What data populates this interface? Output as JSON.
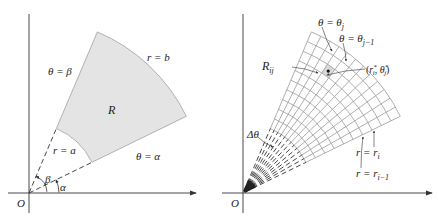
{
  "left_panel": {
    "origin_label": "O",
    "region_label": "R",
    "outer_arc_label": "r = b",
    "inner_arc_label": "r = a",
    "upper_ray_label": "θ = β",
    "lower_ray_label": "θ = α",
    "angle_beta_label": "β",
    "angle_alpha_label": "α",
    "colors": {
      "region_fill": "#e4e4e4",
      "region_stroke": "#a8a8a8",
      "axis": "#333333"
    },
    "geometry": {
      "origin": [
        29,
        193
      ],
      "alpha_deg": 26,
      "beta_deg": 67,
      "a": 70,
      "b": 175
    }
  },
  "right_panel": {
    "origin_label": "O",
    "cell_label": "R",
    "cell_label_sub": "ij",
    "sample_point_label": "(r",
    "sample_point_r_sub": "i",
    "sample_point_theta": "θ",
    "sample_point_theta_sub": "j",
    "theta_j_label": "θ = θ",
    "theta_j_sub": "j",
    "theta_j1_label": "θ = θ",
    "theta_j1_sub": "j−1",
    "r_i_label": "r = r",
    "r_i_sub": "i",
    "r_i1_label": "r = r",
    "r_i1_sub": "i−1",
    "delta_theta_label": "Δθ",
    "colors": {
      "grid": "#9a9a9a",
      "cell_fill": "#d8d8d8",
      "axis": "#333333"
    },
    "geometry": {
      "origin": [
        243,
        193
      ],
      "alpha_deg": 26,
      "beta_deg": 67,
      "a": 70,
      "b": 175,
      "radial_divisions": 10,
      "angular_divisions": 12
    }
  }
}
